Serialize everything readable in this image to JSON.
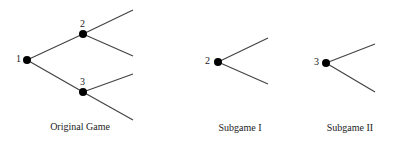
{
  "diagrams": [
    {
      "caption": "Original Game",
      "nodes": [
        "1",
        "2",
        "3"
      ]
    },
    {
      "caption": "Subgame I",
      "nodes": [
        "2"
      ]
    },
    {
      "caption": "Subgame II",
      "nodes": [
        "3"
      ]
    }
  ],
  "colors": {
    "line": "#444444",
    "node": "#000000"
  }
}
